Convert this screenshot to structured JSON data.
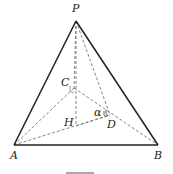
{
  "diagram": {
    "type": "tetrahedron",
    "points": {
      "P": {
        "label": "P",
        "x": 76,
        "y": 21
      },
      "A": {
        "label": "A",
        "x": 14,
        "y": 145
      },
      "B": {
        "label": "B",
        "x": 158,
        "y": 145
      },
      "C": {
        "label": "C",
        "x": 74,
        "y": 88
      },
      "H": {
        "label": "H",
        "x": 76,
        "y": 126
      },
      "D": {
        "label": "D",
        "x": 110,
        "y": 115
      }
    },
    "angle_label": "α",
    "solid_edges": [
      "PA",
      "PB",
      "AB"
    ],
    "dashed_edges": [
      "PC",
      "PH",
      "PD",
      "CA",
      "CB",
      "AD",
      "HD"
    ],
    "colors": {
      "solid": "#222222",
      "dashed": "#777777",
      "background": "#ffffff"
    }
  }
}
